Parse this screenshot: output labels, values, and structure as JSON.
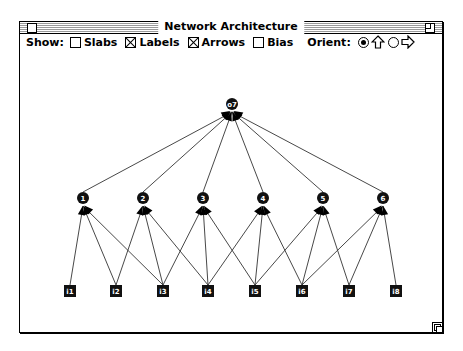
{
  "window": {
    "title": "Network Architecture"
  },
  "toolbar": {
    "show_label": "Show:",
    "options": [
      {
        "label": "Slabs",
        "checked": false
      },
      {
        "label": "Labels",
        "checked": true
      },
      {
        "label": "Arrows",
        "checked": true
      },
      {
        "label": "Bias",
        "checked": false
      }
    ],
    "orient_label": "Orient:",
    "orient_options": [
      {
        "icon": "arrow-up-icon",
        "selected": true
      },
      {
        "icon": "arrow-right-icon",
        "selected": false
      }
    ]
  },
  "network": {
    "output_nodes": [
      {
        "id": "o7",
        "label": "o7"
      }
    ],
    "hidden_nodes": [
      {
        "id": "1",
        "label": "1"
      },
      {
        "id": "2",
        "label": "2"
      },
      {
        "id": "3",
        "label": "3"
      },
      {
        "id": "4",
        "label": "4"
      },
      {
        "id": "5",
        "label": "5"
      },
      {
        "id": "6",
        "label": "6"
      }
    ],
    "input_nodes": [
      {
        "id": "i1",
        "label": "i1"
      },
      {
        "id": "i2",
        "label": "i2"
      },
      {
        "id": "i3",
        "label": "i3"
      },
      {
        "id": "i4",
        "label": "i4"
      },
      {
        "id": "i5",
        "label": "i5"
      },
      {
        "id": "i6",
        "label": "i6"
      },
      {
        "id": "i7",
        "label": "i7"
      },
      {
        "id": "i8",
        "label": "i8"
      }
    ],
    "connections": [
      [
        "1",
        "o7"
      ],
      [
        "2",
        "o7"
      ],
      [
        "3",
        "o7"
      ],
      [
        "4",
        "o7"
      ],
      [
        "5",
        "o7"
      ],
      [
        "6",
        "o7"
      ],
      [
        "i1",
        "1"
      ],
      [
        "i2",
        "1"
      ],
      [
        "i3",
        "1"
      ],
      [
        "i2",
        "2"
      ],
      [
        "i3",
        "2"
      ],
      [
        "i4",
        "2"
      ],
      [
        "i3",
        "3"
      ],
      [
        "i4",
        "3"
      ],
      [
        "i5",
        "3"
      ],
      [
        "i4",
        "4"
      ],
      [
        "i5",
        "4"
      ],
      [
        "i6",
        "4"
      ],
      [
        "i5",
        "5"
      ],
      [
        "i6",
        "5"
      ],
      [
        "i7",
        "5"
      ],
      [
        "i6",
        "6"
      ],
      [
        "i7",
        "6"
      ],
      [
        "i8",
        "6"
      ]
    ]
  }
}
